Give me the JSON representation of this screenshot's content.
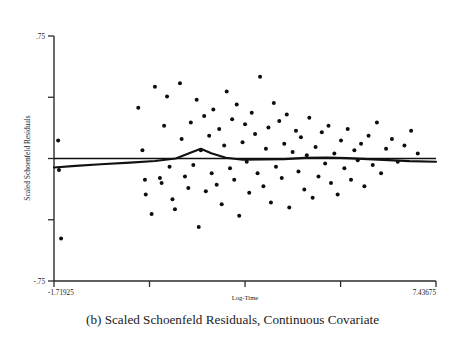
{
  "figure": {
    "caption": "(b)  Scaled Schoenfeld Residuals, Continuous Covariate",
    "caption_label": "(b)"
  },
  "chart_data": {
    "type": "scatter",
    "title": "",
    "xlabel": "Log-Time",
    "ylabel": "Scaled Schoenfeld Residuals",
    "xlim": [
      -1.71925,
      7.43675
    ],
    "ylim": [
      -0.75,
      0.75
    ],
    "grid": false,
    "legend": null,
    "x_tick_labels": [
      "-1.71925",
      "",
      "",
      "",
      "7.43675"
    ],
    "x_tick_values": [
      -1.71925,
      0.57,
      2.86,
      5.15,
      7.43675
    ],
    "y_tick_labels": [
      ".75",
      "",
      "",
      "",
      "-.75"
    ],
    "y_tick_values": [
      0.75,
      0.375,
      0.0,
      -0.375,
      -0.75
    ],
    "points": [
      [
        -1.62,
        0.11
      ],
      [
        -1.6,
        -0.07
      ],
      [
        -1.55,
        -0.49
      ],
      [
        0.3,
        0.31
      ],
      [
        0.4,
        0.05
      ],
      [
        0.46,
        -0.13
      ],
      [
        0.48,
        -0.22
      ],
      [
        0.62,
        -0.34
      ],
      [
        0.7,
        0.44
      ],
      [
        0.82,
        -0.12
      ],
      [
        0.86,
        -0.15
      ],
      [
        0.92,
        0.2
      ],
      [
        0.99,
        0.38
      ],
      [
        1.05,
        -0.05
      ],
      [
        1.12,
        -0.25
      ],
      [
        1.18,
        -0.31
      ],
      [
        1.3,
        0.46
      ],
      [
        1.34,
        0.12
      ],
      [
        1.42,
        -0.11
      ],
      [
        1.5,
        -0.18
      ],
      [
        1.56,
        0.22
      ],
      [
        1.62,
        -0.04
      ],
      [
        1.7,
        0.36
      ],
      [
        1.75,
        -0.42
      ],
      [
        1.8,
        0.05
      ],
      [
        1.88,
        0.26
      ],
      [
        1.92,
        -0.2
      ],
      [
        2.0,
        0.14
      ],
      [
        2.06,
        -0.09
      ],
      [
        2.1,
        0.3
      ],
      [
        2.18,
        -0.16
      ],
      [
        2.24,
        0.18
      ],
      [
        2.3,
        -0.28
      ],
      [
        2.36,
        0.08
      ],
      [
        2.42,
        0.41
      ],
      [
        2.5,
        -0.06
      ],
      [
        2.55,
        0.24
      ],
      [
        2.6,
        -0.13
      ],
      [
        2.66,
        0.33
      ],
      [
        2.72,
        -0.35
      ],
      [
        2.8,
        0.1
      ],
      [
        2.86,
        0.21
      ],
      [
        2.9,
        -0.02
      ],
      [
        2.96,
        -0.21
      ],
      [
        3.02,
        0.28
      ],
      [
        3.1,
        0.15
      ],
      [
        3.16,
        -0.09
      ],
      [
        3.22,
        0.5
      ],
      [
        3.3,
        -0.17
      ],
      [
        3.36,
        0.06
      ],
      [
        3.42,
        0.19
      ],
      [
        3.48,
        -0.27
      ],
      [
        3.55,
        0.34
      ],
      [
        3.6,
        -0.05
      ],
      [
        3.68,
        0.23
      ],
      [
        3.74,
        -0.12
      ],
      [
        3.8,
        0.09
      ],
      [
        3.86,
        0.27
      ],
      [
        3.92,
        -0.3
      ],
      [
        4.0,
        0.04
      ],
      [
        4.08,
        0.17
      ],
      [
        4.14,
        -0.08
      ],
      [
        4.2,
        0.13
      ],
      [
        4.28,
        -0.19
      ],
      [
        4.34,
        0.02
      ],
      [
        4.4,
        0.25
      ],
      [
        4.48,
        -0.24
      ],
      [
        4.55,
        0.07
      ],
      [
        4.62,
        -0.11
      ],
      [
        4.7,
        0.16
      ],
      [
        4.78,
        -0.03
      ],
      [
        4.86,
        0.2
      ],
      [
        4.92,
        -0.15
      ],
      [
        5.0,
        0.03
      ],
      [
        5.08,
        -0.22
      ],
      [
        5.16,
        0.11
      ],
      [
        5.24,
        -0.06
      ],
      [
        5.32,
        0.18
      ],
      [
        5.4,
        -0.13
      ],
      [
        5.48,
        0.05
      ],
      [
        5.56,
        -0.01
      ],
      [
        5.64,
        0.09
      ],
      [
        5.72,
        -0.17
      ],
      [
        5.82,
        0.14
      ],
      [
        5.92,
        -0.04
      ],
      [
        6.02,
        0.22
      ],
      [
        6.12,
        -0.09
      ],
      [
        6.24,
        0.06
      ],
      [
        6.38,
        0.12
      ],
      [
        6.52,
        -0.02
      ],
      [
        6.68,
        0.08
      ],
      [
        6.84,
        0.17
      ],
      [
        7.0,
        0.03
      ]
    ],
    "reference_line": {
      "description": "horizontal zero line",
      "y": 0.0
    },
    "smooth_line": {
      "description": "lowess smoother of residuals vs log-time",
      "x": [
        -1.71925,
        -1.2,
        -0.6,
        0.1,
        0.7,
        1.2,
        1.55,
        1.8,
        2.05,
        2.4,
        2.8,
        3.3,
        3.8,
        4.3,
        4.8,
        5.3,
        5.8,
        6.3,
        6.8,
        7.43675
      ],
      "y": [
        -0.055,
        -0.045,
        -0.035,
        -0.025,
        -0.015,
        0.0,
        0.035,
        0.06,
        0.032,
        0.005,
        -0.008,
        -0.006,
        -0.004,
        0.004,
        0.006,
        0.002,
        -0.004,
        -0.01,
        -0.016,
        -0.02
      ]
    }
  }
}
